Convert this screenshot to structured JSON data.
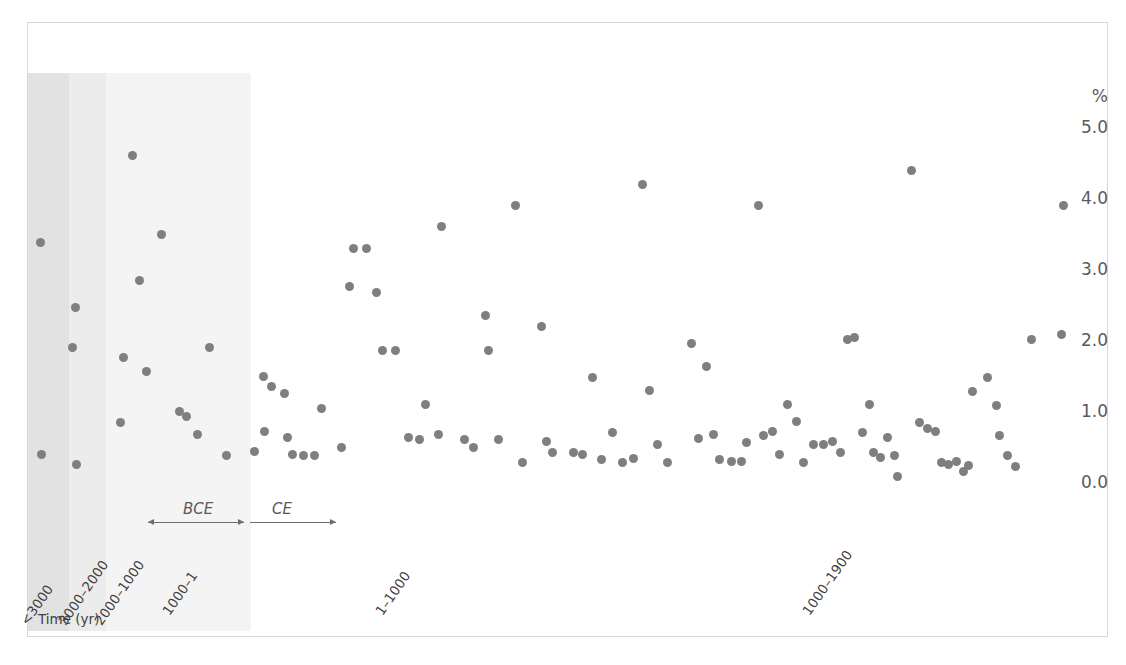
{
  "chart_data": {
    "type": "scatter",
    "title": "Cancer Crude Prevalence (%) [95% CI] by Time",
    "xlabel": "Time (yr)",
    "ylabel": "%",
    "ylim": [
      0.0,
      5.0
    ],
    "yticks": [
      "5.0",
      "4.0",
      "3.0",
      "2.0",
      "1.0",
      "0.0"
    ],
    "ytick_values": [
      5.0,
      4.0,
      3.0,
      2.0,
      1.0,
      0.0
    ],
    "grid": false,
    "legend": "none",
    "categories": [
      "<3000",
      "3000-2000",
      "2000-1000",
      "1000-1",
      "1-1000",
      "1000-1900"
    ],
    "xtick_labels": [
      "<3000",
      "3000–2000",
      "2000–1000",
      "1000–1",
      "1–1000",
      "1000–1900"
    ],
    "era_annotations": [
      {
        "label": "BCE",
        "style": "double-arrow"
      },
      {
        "label": "CE",
        "style": "right-arrow"
      }
    ],
    "band_shading": [
      "#e2e2e2",
      "#ececec",
      "#f4f4f4"
    ],
    "point_color": "#7f7f7f",
    "points": [
      {
        "x": 39,
        "y": 3.4
      },
      {
        "x": 40,
        "y": 0.42
      },
      {
        "x": 74,
        "y": 2.48
      },
      {
        "x": 71,
        "y": 1.92
      },
      {
        "x": 75,
        "y": 0.28
      },
      {
        "x": 131,
        "y": 4.63
      },
      {
        "x": 138,
        "y": 2.86
      },
      {
        "x": 122,
        "y": 1.78
      },
      {
        "x": 145,
        "y": 1.58
      },
      {
        "x": 119,
        "y": 0.86
      },
      {
        "x": 160,
        "y": 3.52
      },
      {
        "x": 178,
        "y": 1.02
      },
      {
        "x": 185,
        "y": 0.95
      },
      {
        "x": 208,
        "y": 1.92
      },
      {
        "x": 196,
        "y": 0.7
      },
      {
        "x": 225,
        "y": 0.4
      },
      {
        "x": 262,
        "y": 1.52
      },
      {
        "x": 270,
        "y": 1.38
      },
      {
        "x": 263,
        "y": 0.74
      },
      {
        "x": 283,
        "y": 1.28
      },
      {
        "x": 286,
        "y": 0.66
      },
      {
        "x": 291,
        "y": 0.42
      },
      {
        "x": 302,
        "y": 0.4
      },
      {
        "x": 313,
        "y": 0.4
      },
      {
        "x": 320,
        "y": 1.06
      },
      {
        "x": 340,
        "y": 0.52
      },
      {
        "x": 253,
        "y": 0.46
      },
      {
        "x": 352,
        "y": 3.32
      },
      {
        "x": 365,
        "y": 3.32
      },
      {
        "x": 348,
        "y": 2.78
      },
      {
        "x": 375,
        "y": 2.7
      },
      {
        "x": 381,
        "y": 1.88
      },
      {
        "x": 394,
        "y": 1.88
      },
      {
        "x": 424,
        "y": 1.12
      },
      {
        "x": 437,
        "y": 0.7
      },
      {
        "x": 407,
        "y": 0.66
      },
      {
        "x": 418,
        "y": 0.62
      },
      {
        "x": 440,
        "y": 3.62
      },
      {
        "x": 463,
        "y": 0.62
      },
      {
        "x": 472,
        "y": 0.52
      },
      {
        "x": 484,
        "y": 2.38
      },
      {
        "x": 487,
        "y": 1.88
      },
      {
        "x": 497,
        "y": 0.62
      },
      {
        "x": 514,
        "y": 3.92
      },
      {
        "x": 521,
        "y": 0.3
      },
      {
        "x": 540,
        "y": 2.22
      },
      {
        "x": 545,
        "y": 0.6
      },
      {
        "x": 551,
        "y": 0.44
      },
      {
        "x": 572,
        "y": 0.44
      },
      {
        "x": 581,
        "y": 0.42
      },
      {
        "x": 591,
        "y": 1.5
      },
      {
        "x": 600,
        "y": 0.34
      },
      {
        "x": 611,
        "y": 0.72
      },
      {
        "x": 621,
        "y": 0.3
      },
      {
        "x": 632,
        "y": 0.36
      },
      {
        "x": 641,
        "y": 4.22
      },
      {
        "x": 648,
        "y": 1.32
      },
      {
        "x": 656,
        "y": 0.56
      },
      {
        "x": 666,
        "y": 0.3
      },
      {
        "x": 690,
        "y": 1.98
      },
      {
        "x": 697,
        "y": 0.64
      },
      {
        "x": 705,
        "y": 1.66
      },
      {
        "x": 712,
        "y": 0.7
      },
      {
        "x": 718,
        "y": 0.34
      },
      {
        "x": 730,
        "y": 0.32
      },
      {
        "x": 740,
        "y": 0.32
      },
      {
        "x": 745,
        "y": 0.58
      },
      {
        "x": 757,
        "y": 3.92
      },
      {
        "x": 762,
        "y": 0.68
      },
      {
        "x": 771,
        "y": 0.74
      },
      {
        "x": 778,
        "y": 0.42
      },
      {
        "x": 786,
        "y": 1.12
      },
      {
        "x": 795,
        "y": 0.88
      },
      {
        "x": 802,
        "y": 0.3
      },
      {
        "x": 812,
        "y": 0.56
      },
      {
        "x": 822,
        "y": 0.56
      },
      {
        "x": 831,
        "y": 0.6
      },
      {
        "x": 839,
        "y": 0.44
      },
      {
        "x": 846,
        "y": 2.04
      },
      {
        "x": 853,
        "y": 2.06
      },
      {
        "x": 861,
        "y": 0.72
      },
      {
        "x": 868,
        "y": 1.12
      },
      {
        "x": 872,
        "y": 0.44
      },
      {
        "x": 879,
        "y": 0.38
      },
      {
        "x": 886,
        "y": 0.66
      },
      {
        "x": 893,
        "y": 0.4
      },
      {
        "x": 896,
        "y": 0.1
      },
      {
        "x": 910,
        "y": 4.42
      },
      {
        "x": 918,
        "y": 0.86
      },
      {
        "x": 926,
        "y": 0.78
      },
      {
        "x": 934,
        "y": 0.74
      },
      {
        "x": 940,
        "y": 0.3
      },
      {
        "x": 947,
        "y": 0.28
      },
      {
        "x": 955,
        "y": 0.32
      },
      {
        "x": 962,
        "y": 0.18
      },
      {
        "x": 967,
        "y": 0.26
      },
      {
        "x": 971,
        "y": 1.3
      },
      {
        "x": 986,
        "y": 1.5
      },
      {
        "x": 995,
        "y": 1.1
      },
      {
        "x": 998,
        "y": 0.68
      },
      {
        "x": 1006,
        "y": 0.4
      },
      {
        "x": 1014,
        "y": 0.24
      },
      {
        "x": 1030,
        "y": 2.04
      },
      {
        "x": 1060,
        "y": 2.1
      },
      {
        "x": 1062,
        "y": 3.92
      }
    ]
  }
}
